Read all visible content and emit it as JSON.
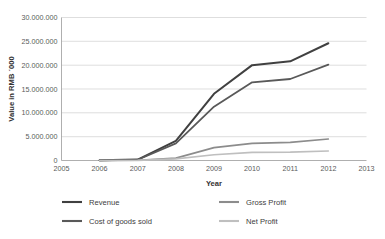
{
  "chart_data": {
    "type": "line",
    "title": "",
    "xlabel": "Year",
    "ylabel": "Value in RMB ´000",
    "x": [
      2005,
      2006,
      2007,
      2008,
      2009,
      2010,
      2011,
      2012,
      2013
    ],
    "xtick_labels": [
      "2005",
      "2006",
      "2007",
      "2008",
      "2009",
      "2010",
      "2011",
      "2012",
      "2013"
    ],
    "xlim": [
      2005,
      2013
    ],
    "ylim": [
      0,
      30000000
    ],
    "ytick_values": [
      0,
      5000000,
      10000000,
      15000000,
      20000000,
      25000000,
      30000000
    ],
    "ytick_labels": [
      "0",
      "5.000.000",
      "10.000.000",
      "15.000.000",
      "20.000.000",
      "25.000.000",
      "30.000.000"
    ],
    "grid": "horizontal",
    "legend_position": "bottom",
    "series": [
      {
        "name": "Revenue",
        "color": "#404040",
        "width": 2.0,
        "x": [
          2006,
          2007,
          2008,
          2009,
          2010,
          2011,
          2012
        ],
        "values": [
          40000,
          200000,
          4100000,
          14000000,
          20000000,
          20800000,
          24600000
        ]
      },
      {
        "name": "Cost of goods sold",
        "color": "#595959",
        "width": 1.8,
        "x": [
          2006,
          2007,
          2008,
          2009,
          2010,
          2011,
          2012
        ],
        "values": [
          30000,
          150000,
          3600000,
          11300000,
          16400000,
          17100000,
          20100000
        ]
      },
      {
        "name": "Gross Profit",
        "color": "#8c8c8c",
        "width": 1.6,
        "x": [
          2006,
          2007,
          2008,
          2009,
          2010,
          2011,
          2012
        ],
        "values": [
          10000,
          50000,
          500000,
          2700000,
          3600000,
          3800000,
          4500000
        ]
      },
      {
        "name": "Net Profit",
        "color": "#bfbfbf",
        "width": 1.6,
        "x": [
          2006,
          2007,
          2008,
          2009,
          2010,
          2011,
          2012
        ],
        "values": [
          8000,
          30000,
          350000,
          1200000,
          1700000,
          1750000,
          2000000
        ]
      }
    ]
  },
  "legend": {
    "entries": [
      {
        "label": "Revenue",
        "color": "#404040"
      },
      {
        "label": "Gross Profit",
        "color": "#8c8c8c"
      },
      {
        "label": "Cost of goods sold",
        "color": "#595959"
      },
      {
        "label": "Net Profit",
        "color": "#bfbfbf"
      }
    ]
  },
  "style": {
    "gridline_color": "#d0d0d0",
    "axis_color": "#9a9a9a",
    "background": "#ffffff"
  }
}
